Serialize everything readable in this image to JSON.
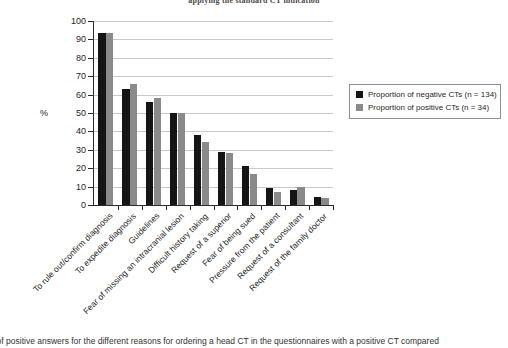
{
  "chart_data": {
    "type": "bar",
    "title": "applying the standard CT indication",
    "xlabel": "",
    "ylabel": "%",
    "ylim": [
      0,
      100
    ],
    "ytick_step": 10,
    "yticks": [
      100,
      90,
      80,
      70,
      60,
      50,
      40,
      30,
      20,
      10,
      0
    ],
    "grid": true,
    "legend_position": "right",
    "categories": [
      "To rule out/confirm diagnosis",
      "To expedite diagnosis",
      "Guidelines",
      "Fear of missing an intracranial lesion",
      "Difficult history taking",
      "Request of a superior",
      "Fear of being sued",
      "Pressure from the patient",
      "Request of a consultant",
      "Request of the family doctor"
    ],
    "series": [
      {
        "name": "Proportion of negative CTs (n = 134)",
        "color": "#151515",
        "values": [
          93.5,
          63,
          56,
          50,
          38,
          29,
          21,
          9.5,
          8,
          4.5
        ]
      },
      {
        "name": "Proportion of positive CTs (n = 34)",
        "color": "#8a8a8a",
        "values": [
          93.5,
          66,
          58,
          50,
          34,
          28,
          17,
          7,
          10,
          4
        ]
      }
    ]
  },
  "legend": {
    "entries": [
      {
        "label": "Proportion of negative CTs (n = 134)",
        "swatch": "neg"
      },
      {
        "label": "Proportion of positive CTs (n = 34)",
        "swatch": "pos"
      }
    ]
  },
  "axis": {
    "y_title": "%",
    "y_tick_labels": [
      "100",
      "90",
      "80",
      "70",
      "60",
      "50",
      "40",
      "30",
      "20",
      "10",
      "0"
    ]
  },
  "caption": {
    "text": "s of positive answers for the different reasons for ordering a head CT in the questionnaires with a positive CT compared"
  }
}
